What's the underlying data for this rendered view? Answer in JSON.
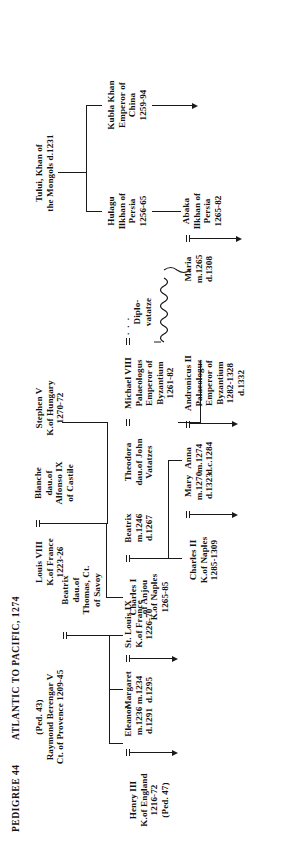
{
  "document": {
    "pedigree_label": "PEDIGREE 44",
    "title": "ATLANTIC TO PACIFIC, 1274"
  },
  "people": [
    {
      "id": "raymond-berengar-v",
      "lines": [
        "(Ped. 43)",
        "Raymond Berengar V",
        "Ct. of Provence 1209-45"
      ]
    },
    {
      "id": "beatrix-of-savoy",
      "lines": [
        "Beatrix",
        "dau.of",
        "Thomas, Ct.",
        "of Savoy"
      ]
    },
    {
      "id": "henry-iii",
      "lines": [
        "Henry III",
        "K.of England",
        "1216-72",
        "(Ped. 47)"
      ]
    },
    {
      "id": "eleanor",
      "lines": [
        "Eleanor",
        "m.1236",
        "d.1291"
      ]
    },
    {
      "id": "margaret",
      "lines": [
        "Margaret",
        "m.1234",
        "d.1295"
      ]
    },
    {
      "id": "st-louis-ix",
      "lines": [
        "St. Louis IX",
        "K.of France",
        "1226-70"
      ]
    },
    {
      "id": "louis-viii",
      "lines": [
        "Louis VIII",
        "K.of France",
        "1223-26"
      ]
    },
    {
      "id": "blanche",
      "lines": [
        "Blanche",
        "dau.of",
        "Alfonso IX",
        "of Castile"
      ]
    },
    {
      "id": "charles-i",
      "lines": [
        "Charles I",
        "of Anjou",
        "K.of Naples",
        "1265-85"
      ]
    },
    {
      "id": "beatrix-of-provence",
      "lines": [
        "Beatrix",
        "m.1246",
        "d.1267"
      ]
    },
    {
      "id": "stephen-v",
      "lines": [
        "Stephen V",
        "K.of Hungary",
        "1270-72"
      ]
    },
    {
      "id": "theodora",
      "lines": [
        "Theodora",
        "dau.of John",
        "Vatatzes"
      ]
    },
    {
      "id": "michael-viii",
      "lines": [
        "Michael VIII",
        "Palaeologus",
        "Emperor of",
        "Byzantium",
        "1261-82"
      ]
    },
    {
      "id": "diplovatatze",
      "lines": [
        "Diplo-",
        "vatatze"
      ]
    },
    {
      "id": "tului",
      "lines": [
        "Tului, Khan of",
        "the Mongols d.1231"
      ]
    },
    {
      "id": "hulagu",
      "lines": [
        "Hulagu",
        "Ilkhan of",
        "Persia",
        "1256-65"
      ]
    },
    {
      "id": "kubla-khan",
      "lines": [
        "Kubla Khan",
        "Emperor of",
        "China",
        "1259-94"
      ]
    },
    {
      "id": "charles-ii",
      "lines": [
        "Charles II",
        "K.of Naples",
        "1285-1309"
      ]
    },
    {
      "id": "mary",
      "lines": [
        "Mary",
        "m.1270",
        "d.1323"
      ]
    },
    {
      "id": "anna",
      "lines": [
        "Anna",
        "m.1274",
        "d.c.1284"
      ]
    },
    {
      "id": "andronicus-ii",
      "lines": [
        "Andronicus II",
        "Palaeologus",
        "Emperor of",
        "Byzantium",
        "1282-1328",
        "d.1332"
      ]
    },
    {
      "id": "maria",
      "lines": [
        "Maria",
        "m.1265",
        "d.1308"
      ]
    },
    {
      "id": "abaka",
      "lines": [
        "Abaka",
        "Ilkhan of",
        "Persia",
        "1265-82"
      ]
    }
  ],
  "symbols": {
    "marriage": "=",
    "illegitimate_dots": ". . .",
    "continuation_arrow": "→"
  },
  "colors": {
    "ink": "#1a1a1a",
    "paper": "#ffffff"
  }
}
